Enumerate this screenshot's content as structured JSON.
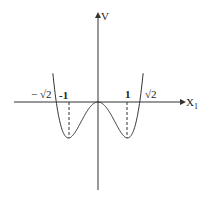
{
  "chart_data": {
    "type": "line",
    "title": "",
    "function": "V(x1) = x1^4 - 2*x1^2 (double-well potential)",
    "xlabel": "X1",
    "ylabel": "V",
    "x_tick_labels": [
      "-√2",
      "-1",
      "1",
      "√2"
    ],
    "x_tick_values": [
      -1.414,
      -1,
      1,
      1.414
    ],
    "key_points": [
      {
        "x": -1.414,
        "y": 0,
        "label": "-√2"
      },
      {
        "x": -1,
        "y": -1,
        "label": "local minimum"
      },
      {
        "x": 0,
        "y": 0,
        "label": "local maximum"
      },
      {
        "x": 1,
        "y": -1,
        "label": "local minimum"
      },
      {
        "x": 1.414,
        "y": 0,
        "label": "√2"
      }
    ],
    "dashed_guides_at_x": [
      -1,
      1
    ],
    "grid": false,
    "legend": null
  },
  "labels": {
    "y_axis": "V",
    "x_axis": "X",
    "x_axis_sub": "1",
    "neg_sqrt2": "− √2",
    "neg_one": "-1",
    "one": "1",
    "sqrt2": "√2"
  }
}
